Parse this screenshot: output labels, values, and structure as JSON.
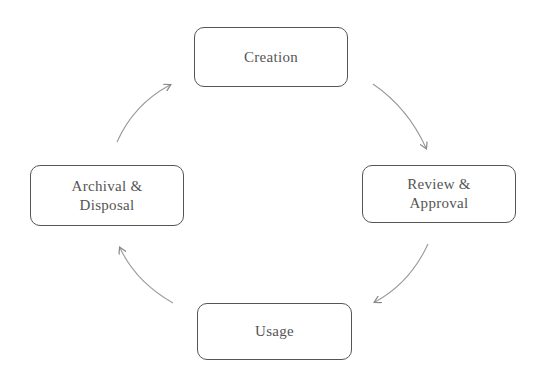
{
  "diagram": {
    "type": "cycle",
    "nodes": [
      {
        "id": "creation",
        "label": "Creation"
      },
      {
        "id": "review",
        "label": "Review &\nApproval"
      },
      {
        "id": "usage",
        "label": "Usage"
      },
      {
        "id": "archival",
        "label": "Archival &\nDisposal"
      }
    ],
    "edges": [
      {
        "from": "creation",
        "to": "review"
      },
      {
        "from": "review",
        "to": "usage"
      },
      {
        "from": "usage",
        "to": "archival"
      },
      {
        "from": "archival",
        "to": "creation"
      }
    ],
    "colors": {
      "stroke": "#555555",
      "arrow": "#888888",
      "text": "#555555",
      "background": "#ffffff"
    }
  }
}
